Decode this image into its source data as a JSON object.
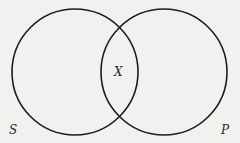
{
  "diagram": {
    "type": "venn",
    "sets": [
      {
        "name": "S",
        "cx": 75,
        "cy": 72,
        "r": 63
      },
      {
        "name": "P",
        "cx": 164,
        "cy": 72,
        "r": 63
      }
    ],
    "labels": {
      "left_set": "S",
      "right_set": "P",
      "intersection_mark": "X"
    },
    "colors": {
      "stroke": "#1c1c1c",
      "background": "#f1f1f0",
      "text": "#2a2a2a"
    }
  }
}
